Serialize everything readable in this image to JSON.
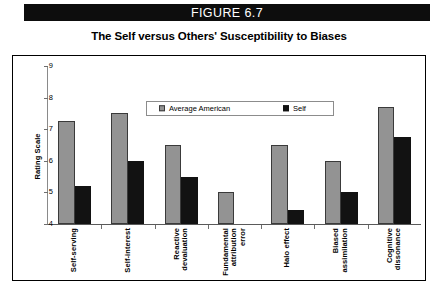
{
  "banner": {
    "label": "FIGURE 6.7"
  },
  "chart_data": {
    "type": "bar",
    "title": "The Self versus Others' Susceptibility to Biases",
    "xlabel": "",
    "ylabel": "Rating Scale",
    "ylim": [
      4,
      9
    ],
    "yticks": [
      4,
      5,
      6,
      7,
      8,
      9
    ],
    "grid": false,
    "legend_position": "top-center",
    "categories": [
      "Self-serving",
      "Self-interest",
      "Reactive devaluation",
      "Fundamental attribution error",
      "Halo effect",
      "Biased assimilation",
      "Cognitive dissonance"
    ],
    "category_lines": [
      [
        "Self-serving"
      ],
      [
        "Self-interest"
      ],
      [
        "Reactive",
        "devaluation"
      ],
      [
        "Fundamental",
        "attribution",
        "error"
      ],
      [
        "Halo effect"
      ],
      [
        "Biased",
        "assimilation"
      ],
      [
        "Cognitive",
        "dissonance"
      ]
    ],
    "series": [
      {
        "name": "Average American",
        "color": "#939393",
        "values": [
          7.25,
          7.5,
          6.5,
          5.0,
          6.5,
          6.0,
          7.7
        ]
      },
      {
        "name": "Self",
        "color": "#121212",
        "values": [
          5.2,
          6.0,
          5.5,
          4.0,
          4.45,
          5.0,
          6.75
        ]
      }
    ]
  }
}
